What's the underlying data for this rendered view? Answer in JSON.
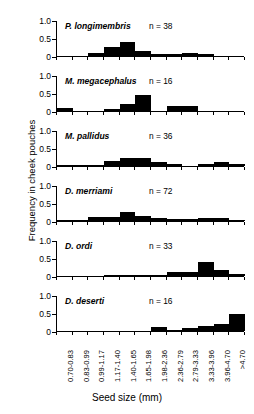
{
  "chart_data": {
    "type": "bar",
    "title": "",
    "xlabel": "Seed size (mm)",
    "ylabel": "Frequency in cheek pouches",
    "ylim": [
      0,
      1.0
    ],
    "yticks": [
      "0",
      "0.5",
      "1.0"
    ],
    "ytick_values": [
      0,
      0.5,
      1.0
    ],
    "grid": false,
    "legend": "none",
    "categories": [
      "0.70-0.83",
      "0.83-0.99",
      "0.99-1.17",
      "1.17-1.40",
      "1.40-1.65",
      "1.65-1.98",
      "1.98-2.36",
      "2.36-2.79",
      "2.79-3.33",
      "3.33-3.96",
      "3.96-4.70",
      ">4.70"
    ],
    "series": [
      {
        "name": "P. longimembris",
        "n_label": "n = 38",
        "n": 38,
        "values": [
          0.0,
          0.0,
          0.08,
          0.24,
          0.39,
          0.13,
          0.05,
          0.05,
          0.08,
          0.06,
          0.0,
          0.0
        ]
      },
      {
        "name": "M. megacephalus",
        "n_label": "n = 16",
        "n": 16,
        "values": [
          0.07,
          0.0,
          0.0,
          0.06,
          0.19,
          0.44,
          0.0,
          0.13,
          0.13,
          0.0,
          0.0,
          0.0
        ]
      },
      {
        "name": "M. pallidus",
        "n_label": "n = 36",
        "n": 36,
        "values": [
          0.03,
          0.03,
          0.03,
          0.14,
          0.21,
          0.21,
          0.11,
          0.05,
          0.0,
          0.05,
          0.12,
          0.05
        ]
      },
      {
        "name": "D. merriami",
        "n_label": "n = 72",
        "n": 72,
        "values": [
          0.03,
          0.04,
          0.11,
          0.1,
          0.26,
          0.13,
          0.07,
          0.06,
          0.06,
          0.09,
          0.08,
          0.03
        ]
      },
      {
        "name": "D. ordi",
        "n_label": "n = 33",
        "n": 33,
        "values": [
          0.0,
          0.0,
          0.0,
          0.02,
          0.03,
          0.03,
          0.03,
          0.11,
          0.12,
          0.39,
          0.17,
          0.06
        ]
      },
      {
        "name": "D. deserti",
        "n_label": "n = 16",
        "n": 16,
        "values": [
          0.0,
          0.0,
          0.0,
          0.0,
          0.0,
          0.0,
          0.11,
          0.02,
          0.07,
          0.15,
          0.19,
          0.47
        ]
      }
    ]
  }
}
